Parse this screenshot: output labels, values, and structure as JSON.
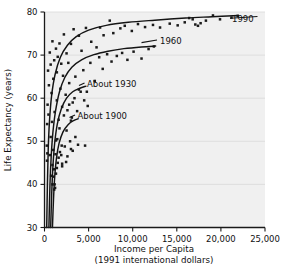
{
  "chart_data": {
    "type": "scatter",
    "title": "",
    "subtitle": "",
    "xlabel": "Income per Capita",
    "xlabel_line2": "(1991 international dollars)",
    "ylabel": "Life Expectancy (years)",
    "xlim": [
      0,
      25000
    ],
    "ylim": [
      30,
      80
    ],
    "grid": "horizontal",
    "legend_position": "inline-curve-labels",
    "x_ticks": [
      0,
      5000,
      10000,
      15000,
      20000,
      25000
    ],
    "x_tick_labels": [
      "0",
      "5,000",
      "10,000",
      "15,000",
      "20,000",
      "25,000"
    ],
    "y_ticks": [
      30,
      40,
      50,
      60,
      70,
      80
    ],
    "y_tick_labels": [
      "30",
      "40",
      "50",
      "60",
      "70",
      "80"
    ],
    "annotations": [
      {
        "text": "1990",
        "x": 22300,
        "y": 79.0
      },
      {
        "text": "1960",
        "x": 12900,
        "y": 72.2
      },
      {
        "text": "About 1930",
        "x": 5100,
        "y": 62.6
      },
      {
        "text": "About 1900",
        "x": 4000,
        "y": 55.2
      }
    ],
    "series": [
      {
        "name": "1990",
        "label": "1990",
        "curve": [
          [
            250,
            30.0
          ],
          [
            330,
            40.0
          ],
          [
            420,
            48.0
          ],
          [
            560,
            54.5
          ],
          [
            800,
            60.5
          ],
          [
            1200,
            65.5
          ],
          [
            1800,
            69.5
          ],
          [
            2600,
            72.3
          ],
          [
            3600,
            74.3
          ],
          [
            5000,
            75.8
          ],
          [
            7000,
            76.9
          ],
          [
            9500,
            77.6
          ],
          [
            12500,
            78.1
          ],
          [
            16000,
            78.6
          ],
          [
            19000,
            78.9
          ],
          [
            22000,
            79.2
          ]
        ],
        "points": [
          [
            600,
            70.6
          ],
          [
            900,
            73.2
          ],
          [
            1300,
            71.5
          ],
          [
            1500,
            69.6
          ],
          [
            1700,
            72.7
          ],
          [
            2200,
            74.8
          ],
          [
            2500,
            70.4
          ],
          [
            2700,
            68.2
          ],
          [
            3000,
            72.6
          ],
          [
            3300,
            76.0
          ],
          [
            3900,
            74.5
          ],
          [
            4200,
            71.0
          ],
          [
            4700,
            76.3
          ],
          [
            5300,
            73.1
          ],
          [
            5900,
            71.8
          ],
          [
            6300,
            76.4
          ],
          [
            6700,
            74.6
          ],
          [
            7400,
            78.0
          ],
          [
            7800,
            75.1
          ],
          [
            8600,
            76.2
          ],
          [
            9100,
            76.8
          ],
          [
            9900,
            75.6
          ],
          [
            10600,
            77.2
          ],
          [
            11400,
            76.5
          ],
          [
            12300,
            77.0
          ],
          [
            13100,
            76.4
          ],
          [
            14200,
            77.3
          ],
          [
            15100,
            76.9
          ],
          [
            15900,
            77.6
          ],
          [
            16400,
            78.6
          ],
          [
            16800,
            78.3
          ],
          [
            17100,
            77.1
          ],
          [
            17400,
            76.8
          ],
          [
            17700,
            77.4
          ],
          [
            18300,
            78.0
          ],
          [
            19100,
            79.2
          ],
          [
            19900,
            78.3
          ],
          [
            21200,
            78.7
          ],
          [
            21900,
            79.1
          ],
          [
            400,
            66.4
          ],
          [
            500,
            63.0
          ],
          [
            700,
            67.8
          ],
          [
            800,
            61.2
          ],
          [
            1000,
            64.5
          ],
          [
            1100,
            68.8
          ],
          [
            1400,
            66.0
          ],
          [
            1900,
            68.0
          ],
          [
            2100,
            65.2
          ],
          [
            350,
            58.5
          ],
          [
            300,
            54.0
          ],
          [
            450,
            56.2
          ],
          [
            260,
            49.0
          ],
          [
            280,
            45.5
          ],
          [
            320,
            47.2
          ]
        ]
      },
      {
        "name": "1960",
        "label": "1960",
        "curve": [
          [
            500,
            30.0
          ],
          [
            620,
            40.0
          ],
          [
            760,
            46.5
          ],
          [
            950,
            52.0
          ],
          [
            1250,
            57.0
          ],
          [
            1700,
            61.5
          ],
          [
            2300,
            64.8
          ],
          [
            3100,
            67.2
          ],
          [
            4200,
            68.9
          ],
          [
            5600,
            70.1
          ],
          [
            7200,
            70.9
          ],
          [
            9000,
            71.5
          ],
          [
            11000,
            71.9
          ],
          [
            12600,
            72.1
          ]
        ],
        "points": [
          [
            700,
            51.0
          ],
          [
            850,
            54.5
          ],
          [
            1000,
            48.0
          ],
          [
            1150,
            56.8
          ],
          [
            1400,
            59.5
          ],
          [
            1600,
            55.0
          ],
          [
            1800,
            62.2
          ],
          [
            2000,
            58.0
          ],
          [
            2400,
            60.8
          ],
          [
            2800,
            63.5
          ],
          [
            3200,
            59.0
          ],
          [
            3500,
            65.0
          ],
          [
            3900,
            62.0
          ],
          [
            4400,
            66.5
          ],
          [
            4800,
            61.5
          ],
          [
            5200,
            68.2
          ],
          [
            5700,
            64.0
          ],
          [
            6200,
            69.5
          ],
          [
            6600,
            66.8
          ],
          [
            7100,
            70.2
          ],
          [
            7600,
            68.5
          ],
          [
            8200,
            69.8
          ],
          [
            8800,
            70.5
          ],
          [
            9400,
            68.9
          ],
          [
            10100,
            70.8
          ],
          [
            11000,
            69.2
          ],
          [
            11800,
            71.4
          ],
          [
            12400,
            72.0
          ],
          [
            900,
            44.5
          ],
          [
            750,
            42.0
          ],
          [
            600,
            46.8
          ],
          [
            1300,
            50.2
          ],
          [
            2600,
            57.2
          ],
          [
            3000,
            54.8
          ]
        ]
      },
      {
        "name": "About 1930",
        "label": "About 1930",
        "curve": [
          [
            700,
            30.0
          ],
          [
            820,
            38.0
          ],
          [
            950,
            44.0
          ],
          [
            1150,
            49.5
          ],
          [
            1450,
            54.0
          ],
          [
            1900,
            57.5
          ],
          [
            2500,
            60.0
          ],
          [
            3200,
            61.5
          ],
          [
            4000,
            62.3
          ],
          [
            4700,
            62.8
          ]
        ],
        "points": [
          [
            900,
            40.0
          ],
          [
            1050,
            43.5
          ],
          [
            1250,
            47.0
          ],
          [
            1450,
            50.5
          ],
          [
            1700,
            53.0
          ],
          [
            1950,
            49.0
          ],
          [
            2200,
            56.0
          ],
          [
            2500,
            52.5
          ],
          [
            2800,
            58.5
          ],
          [
            3100,
            55.5
          ],
          [
            3400,
            60.0
          ],
          [
            3700,
            57.0
          ],
          [
            4100,
            61.5
          ],
          [
            4500,
            59.5
          ],
          [
            4900,
            58.2
          ],
          [
            2000,
            44.8
          ],
          [
            1600,
            46.2
          ],
          [
            3800,
            49.2
          ],
          [
            4600,
            49.0
          ]
        ]
      },
      {
        "name": "About 1900",
        "label": "About 1900",
        "curve": [
          [
            900,
            30.0
          ],
          [
            1020,
            36.5
          ],
          [
            1150,
            41.5
          ],
          [
            1350,
            46.0
          ],
          [
            1650,
            49.5
          ],
          [
            2100,
            52.2
          ],
          [
            2700,
            53.9
          ],
          [
            3300,
            54.8
          ],
          [
            3800,
            55.2
          ]
        ],
        "points": [
          [
            1100,
            38.8
          ],
          [
            1150,
            40.0
          ],
          [
            1300,
            42.5
          ],
          [
            1500,
            45.0
          ],
          [
            1750,
            47.5
          ],
          [
            2000,
            44.2
          ],
          [
            2300,
            48.8
          ],
          [
            2600,
            46.5
          ],
          [
            2900,
            50.0
          ],
          [
            3200,
            47.8
          ],
          [
            3500,
            51.0
          ],
          [
            1200,
            39.2
          ],
          [
            1050,
            41.8
          ],
          [
            1400,
            43.8
          ],
          [
            1900,
            46.8
          ],
          [
            2450,
            45.2
          ],
          [
            3000,
            48.2
          ]
        ]
      }
    ]
  }
}
